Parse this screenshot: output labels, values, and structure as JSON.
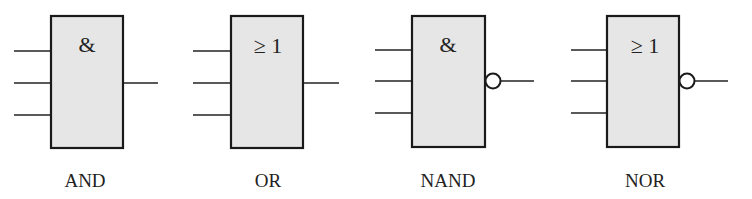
{
  "diagram": {
    "title": "",
    "gates": [
      {
        "name": "AND",
        "symbol": "&",
        "label": "AND",
        "inputs": 3,
        "inverted_output": false
      },
      {
        "name": "OR",
        "symbol": "≥ 1",
        "label": "OR",
        "inputs": 3,
        "inverted_output": false
      },
      {
        "name": "NAND",
        "symbol": "&",
        "label": "NAND",
        "inputs": 3,
        "inverted_output": true
      },
      {
        "name": "NOR",
        "symbol": "≥ 1",
        "label": "NOR",
        "inputs": 3,
        "inverted_output": true
      }
    ],
    "colors": {
      "box_fill": "#e6e6e6",
      "stroke": "#1a1a1a",
      "background": "#ffffff"
    }
  }
}
